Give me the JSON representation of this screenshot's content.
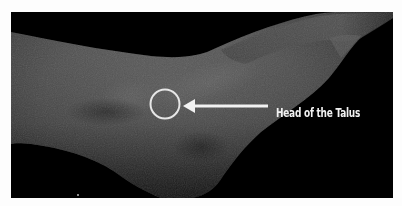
{
  "figure": {
    "background_color": "#000000",
    "frame_color": "#fdfdfd",
    "skin_tone_light": "#6a6a6a",
    "skin_tone_dark": "#2e2e2e"
  },
  "annotation": {
    "label": "Head of the Talus",
    "marker": "circle",
    "marker_color": "#e8e8e8",
    "pointer": "arrow-left",
    "pointer_color": "#f2f2f2"
  }
}
